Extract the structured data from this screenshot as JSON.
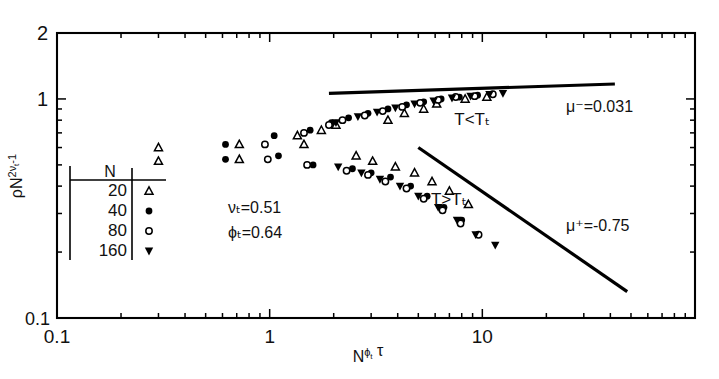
{
  "chart_data": {
    "type": "scatter",
    "title": "",
    "xlabel": "N^{ϕ_t} τ",
    "ylabel": "ρN^{2ν_t-1}",
    "xscale": "log",
    "yscale": "log",
    "xlim": [
      0.1,
      100
    ],
    "ylim": [
      0.1,
      2
    ],
    "xticklabels": [
      "0.1",
      "1",
      "10"
    ],
    "xtickvalues": [
      0.1,
      1,
      10
    ],
    "yticklabels": [
      "2",
      "1",
      "0.1"
    ],
    "ytickvalues": [
      2,
      1,
      0.1
    ],
    "grid": false,
    "legend_position": "inner-left",
    "legend_title": "N",
    "series": [
      {
        "name": "20",
        "marker": "open-triangle-up",
        "points": [
          [
            0.3,
            0.6
          ],
          [
            0.3,
            0.52
          ],
          [
            0.72,
            0.62
          ],
          [
            0.72,
            0.53
          ],
          [
            1.35,
            0.68
          ],
          [
            1.45,
            0.62
          ],
          [
            1.75,
            0.72
          ],
          [
            2.05,
            0.76
          ],
          [
            2.55,
            0.55
          ],
          [
            3.05,
            0.52
          ],
          [
            3.6,
            0.8
          ],
          [
            4.3,
            0.86
          ],
          [
            5.3,
            0.9
          ],
          [
            3.9,
            0.49
          ],
          [
            4.8,
            0.46
          ],
          [
            6.1,
            0.95
          ],
          [
            5.8,
            0.42
          ],
          [
            7.0,
            0.38
          ],
          [
            8.3,
            1.0
          ],
          [
            8.6,
            0.33
          ],
          [
            10.5,
            1.02
          ]
        ]
      },
      {
        "name": "40",
        "marker": "filled-circle",
        "points": [
          [
            0.62,
            0.62
          ],
          [
            0.62,
            0.53
          ],
          [
            1.05,
            0.68
          ],
          [
            1.1,
            0.55
          ],
          [
            1.55,
            0.72
          ],
          [
            1.6,
            0.5
          ],
          [
            1.95,
            0.78
          ],
          [
            2.35,
            0.82
          ],
          [
            2.45,
            0.48
          ],
          [
            2.9,
            0.86
          ],
          [
            3.0,
            0.46
          ],
          [
            3.6,
            0.9
          ],
          [
            3.7,
            0.44
          ],
          [
            4.4,
            0.94
          ],
          [
            4.6,
            0.4
          ],
          [
            5.3,
            0.97
          ],
          [
            5.5,
            0.36
          ],
          [
            6.4,
            1.0
          ],
          [
            6.6,
            0.32
          ],
          [
            7.8,
            1.02
          ],
          [
            8.0,
            0.28
          ],
          [
            9.5,
            1.04
          ]
        ]
      },
      {
        "name": "80",
        "marker": "open-circle",
        "points": [
          [
            0.95,
            0.62
          ],
          [
            0.98,
            0.53
          ],
          [
            1.45,
            0.7
          ],
          [
            1.5,
            0.5
          ],
          [
            1.9,
            0.76
          ],
          [
            2.2,
            0.8
          ],
          [
            2.3,
            0.47
          ],
          [
            2.8,
            0.84
          ],
          [
            2.9,
            0.45
          ],
          [
            3.4,
            0.88
          ],
          [
            3.5,
            0.42
          ],
          [
            4.2,
            0.92
          ],
          [
            4.4,
            0.39
          ],
          [
            5.1,
            0.96
          ],
          [
            5.3,
            0.35
          ],
          [
            6.2,
            0.99
          ],
          [
            6.5,
            0.31
          ],
          [
            7.5,
            1.02
          ],
          [
            7.9,
            0.27
          ],
          [
            9.2,
            1.03
          ],
          [
            9.6,
            0.24
          ],
          [
            11.2,
            1.05
          ]
        ]
      },
      {
        "name": "160",
        "marker": "filled-triangle-down",
        "points": [
          [
            2.05,
            0.78
          ],
          [
            2.1,
            0.49
          ],
          [
            2.6,
            0.83
          ],
          [
            2.7,
            0.46
          ],
          [
            3.2,
            0.87
          ],
          [
            3.3,
            0.43
          ],
          [
            3.9,
            0.91
          ],
          [
            4.1,
            0.4
          ],
          [
            4.8,
            0.95
          ],
          [
            5.0,
            0.36
          ],
          [
            5.9,
            0.98
          ],
          [
            6.2,
            0.32
          ],
          [
            7.2,
            1.01
          ],
          [
            7.6,
            0.28
          ],
          [
            8.8,
            1.03
          ],
          [
            9.3,
            0.24
          ],
          [
            10.8,
            1.05
          ],
          [
            11.5,
            0.215
          ],
          [
            12.5,
            1.06
          ]
        ]
      }
    ],
    "fit_lines": [
      {
        "name": "upper-branch-fit",
        "label": "μ⁻=0.031",
        "x": [
          1.9,
          42.0
        ],
        "y": [
          1.06,
          1.17
        ],
        "slope": 0.031
      },
      {
        "name": "lower-branch-fit",
        "label": "μ⁺=-0.75",
        "x": [
          5.0,
          48.0
        ],
        "y": [
          0.6,
          0.132
        ],
        "slope": -0.75
      }
    ],
    "annotations": [
      {
        "name": "upper-branch-label",
        "text": "T<Tₜ",
        "x": 8.5,
        "y": 0.8
      },
      {
        "name": "lower-branch-label",
        "text": "T>Tₜ",
        "x": 6.6,
        "y": 0.345
      },
      {
        "name": "nu-parameter",
        "text": "νₜ=0.51"
      },
      {
        "name": "phi-parameter",
        "text": "ϕₜ=0.64"
      }
    ]
  },
  "legend": {
    "header": "N",
    "rows": [
      {
        "label": "20",
        "marker": "open-triangle-up"
      },
      {
        "label": "40",
        "marker": "filled-circle"
      },
      {
        "label": "80",
        "marker": "open-circle"
      },
      {
        "label": "160",
        "marker": "filled-triangle-down"
      }
    ]
  },
  "axes": {
    "y_top_label": "2",
    "y_mid_label": "1",
    "y_bottom_label": "0.1",
    "x_left_label": "0.1",
    "x_mid_label": "1",
    "x_right_label": "10",
    "y_title_rho": "ρN",
    "y_title_exp": "2ν",
    "y_title_exp_sub": "t",
    "y_title_exp_tail": "-1",
    "x_title_base": "N",
    "x_title_exp": "ϕ",
    "x_title_exp_sub": "t",
    "x_title_tau": "τ"
  },
  "colors": {
    "ink": "#000000",
    "background": "#ffffff",
    "marker_fill": "#000000",
    "marker_stroke": "#000000"
  }
}
